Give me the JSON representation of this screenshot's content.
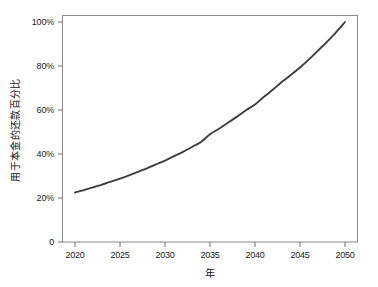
{
  "chart_data": {
    "type": "line",
    "title": "",
    "xlabel": "年",
    "ylabel": "用于本金的还款百分比",
    "xlim": [
      2018.5,
      2052
    ],
    "ylim": [
      0,
      100
    ],
    "grid": false,
    "legend": "none",
    "line_color": "#3d3d3d",
    "axis_color": "#8a8a8a",
    "background": "#ffffff",
    "xticks": [
      2020,
      2025,
      2030,
      2035,
      2040,
      2045,
      2050
    ],
    "xtick_labels": [
      "2020",
      "2025",
      "2030",
      "2035",
      "2040",
      "2045",
      "2050"
    ],
    "yticks": [
      0,
      20,
      40,
      60,
      80,
      100
    ],
    "ytick_labels": [
      "0",
      "20%",
      "40%",
      "60%",
      "80%",
      "100%"
    ],
    "x": [
      2020,
      2021,
      2022,
      2023,
      2024,
      2025,
      2026,
      2027,
      2028,
      2029,
      2030,
      2031,
      2032,
      2033,
      2034,
      2035,
      2036,
      2037,
      2038,
      2039,
      2040,
      2041,
      2042,
      2043,
      2044,
      2045,
      2046,
      2047,
      2048,
      2049,
      2050
    ],
    "values": [
      22.5,
      23.6,
      24.8,
      26.1,
      27.4,
      28.8,
      30.3,
      31.9,
      33.5,
      35.3,
      37.0,
      39.0,
      41.0,
      43.2,
      45.5,
      49.0,
      51.5,
      54.2,
      57.0,
      59.9,
      62.5,
      66.0,
      69.3,
      72.8,
      76.0,
      79.3,
      83.0,
      87.0,
      91.0,
      95.3,
      100.0
    ],
    "series": [
      {
        "name": "用于本金的还款百分比",
        "values": [
          22.5,
          23.6,
          24.8,
          26.1,
          27.4,
          28.8,
          30.3,
          31.9,
          33.5,
          35.3,
          37.0,
          39.0,
          41.0,
          43.2,
          45.5,
          49.0,
          51.5,
          54.2,
          57.0,
          59.9,
          62.5,
          66.0,
          69.3,
          72.8,
          76.0,
          79.3,
          83.0,
          87.0,
          91.0,
          95.3,
          100.0
        ]
      }
    ]
  }
}
